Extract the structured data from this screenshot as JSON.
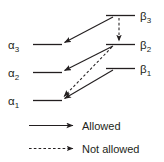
{
  "diagram": {
    "colors": {
      "line": "#231f20",
      "background": "#ffffff",
      "text": "#231f20"
    },
    "left_levels": [
      {
        "id": "alpha3",
        "symbol": "α",
        "subscript": "3",
        "label": "α3"
      },
      {
        "id": "alpha2",
        "symbol": "α",
        "subscript": "2",
        "label": "α2"
      },
      {
        "id": "alpha1",
        "symbol": "α",
        "subscript": "1",
        "label": "α1"
      }
    ],
    "right_levels": [
      {
        "id": "beta3",
        "symbol": "β",
        "subscript": "3",
        "label": "β3"
      },
      {
        "id": "beta2",
        "symbol": "β",
        "subscript": "2",
        "label": "β2"
      },
      {
        "id": "beta1",
        "symbol": "β",
        "subscript": "1",
        "label": "β1"
      }
    ],
    "transitions": [
      {
        "id": "beta3-to-alpha3",
        "from": "beta3",
        "to": "alpha3",
        "style": "solid",
        "kind": "Allowed"
      },
      {
        "id": "beta3-to-beta2",
        "from": "beta3",
        "to": "beta2",
        "style": "dashed",
        "kind": "Not allowed"
      },
      {
        "id": "beta2-to-alpha2",
        "from": "beta2",
        "to": "alpha2",
        "style": "solid",
        "kind": "Allowed"
      },
      {
        "id": "beta2-to-alpha1",
        "from": "beta2",
        "to": "alpha1",
        "style": "dashed",
        "kind": "Not allowed"
      },
      {
        "id": "beta1-to-alpha1",
        "from": "beta1",
        "to": "alpha1",
        "style": "solid",
        "kind": "Allowed"
      }
    ],
    "legend": [
      {
        "id": "allowed",
        "style": "solid",
        "label": "Allowed"
      },
      {
        "id": "not-allowed",
        "style": "dashed",
        "label": "Not allowed"
      }
    ]
  }
}
